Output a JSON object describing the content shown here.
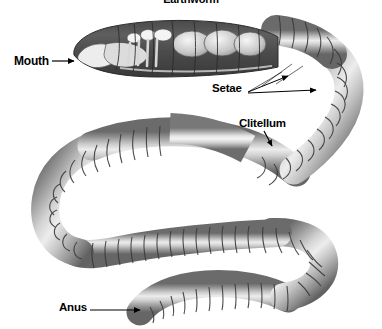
{
  "figure": {
    "title": "Earthworm",
    "organism": "earthworm",
    "view": "lateral cutaway with coiled body",
    "background_color": "#ffffff"
  },
  "labels": {
    "mouth": "Mouth",
    "setae": "Setae",
    "clitellum": "Clitellum",
    "anus": "Anus"
  },
  "colors": {
    "body_dark": "#6e6e6e",
    "body_mid": "#9a9a9a",
    "body_light": "#dcdcdc",
    "body_highlight": "#efefef",
    "segment_line": "#3c3c3c",
    "cutaway_dark": "#3a3a3a",
    "organ_white": "#f2f2f2",
    "leader_line": "#000000",
    "text": "#000000"
  },
  "annotations": [
    {
      "name": "mouth",
      "text": "Mouth",
      "arrow": "right",
      "target": "anterior-opening"
    },
    {
      "name": "setae",
      "text": "Setae",
      "arrow": "right-up",
      "target": "ventral-bristles",
      "arrow_count": 2,
      "leader_count": 3
    },
    {
      "name": "clitellum",
      "text": "Clitellum",
      "arrow": "down-right",
      "target": "smooth-glandular-band"
    },
    {
      "name": "anus",
      "text": "Anus",
      "arrow": "right",
      "target": "posterior-opening"
    }
  ]
}
